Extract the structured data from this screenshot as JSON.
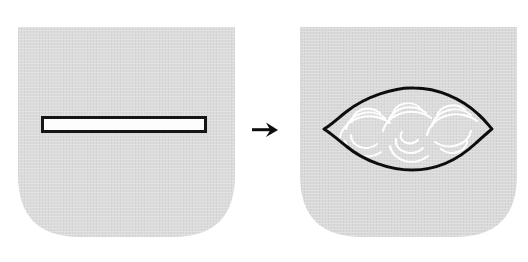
{
  "figure": {
    "type": "process-diagram",
    "orientation": "horizontal",
    "canvas": {
      "width": 528,
      "height": 262
    },
    "background_color": "#ffffff",
    "panel_count": 2,
    "title": ""
  },
  "colors": {
    "panel_fill": "#d9d9d9",
    "panel_fill_light": "#e2e2e2",
    "outline": "#111111",
    "slit_fill": "#fefefe",
    "highlight": "#ffffff",
    "arrow": "#0d0d0d",
    "page_background": "#ffffff"
  },
  "panels": [
    {
      "id": "before",
      "label": "before",
      "name": "flat-flap-with-slit",
      "shape": "rounded-bottom-square",
      "fill": "#d9d9d9",
      "texture": "halftone-weave",
      "bounds": {
        "x": 18,
        "y": 27,
        "width": 217,
        "height": 210
      },
      "corner_radius": {
        "top_left": 0,
        "top_right": 0,
        "bottom_left": 64,
        "bottom_right": 64
      },
      "features": [
        {
          "name": "slit-opening",
          "kind": "rectangle",
          "fill": "#fefefe",
          "stroke": "#111111",
          "stroke_width": 3,
          "bounds": {
            "x": 42,
            "y": 117,
            "width": 164,
            "height": 15
          }
        }
      ]
    },
    {
      "id": "after",
      "label": "after",
      "name": "flap-with-puffed-pouch",
      "shape": "rounded-bottom-square",
      "fill": "#d9d9d9",
      "texture": "halftone-weave",
      "bounds": {
        "x": 300,
        "y": 27,
        "width": 217,
        "height": 210
      },
      "corner_radius": {
        "top_left": 0,
        "top_right": 0,
        "bottom_left": 64,
        "bottom_right": 64
      },
      "features": [
        {
          "name": "lens-pouch",
          "kind": "lens",
          "fill": "#dcdcdc",
          "stroke": "#111111",
          "stroke_width": 3,
          "bounds": {
            "x": 324,
            "y": 88,
            "width": 168,
            "height": 82
          },
          "left_tip_x": 324,
          "right_tip_x": 492,
          "center_y": 129
        },
        {
          "name": "gather-arcs",
          "kind": "scallop-arcs",
          "stroke": "#ffffff",
          "stroke_width": 2,
          "count": 7,
          "description": "concentric white fan arcs indicating gathered fabric"
        }
      ]
    }
  ],
  "arrow": {
    "name": "transformation-arrow",
    "glyph": "right-arrow",
    "direction": "right",
    "color": "#0d0d0d",
    "position": {
      "x": 252,
      "y": 123,
      "width": 26,
      "height": 13
    }
  },
  "captions": {
    "left": "",
    "right": "",
    "visible": false
  }
}
